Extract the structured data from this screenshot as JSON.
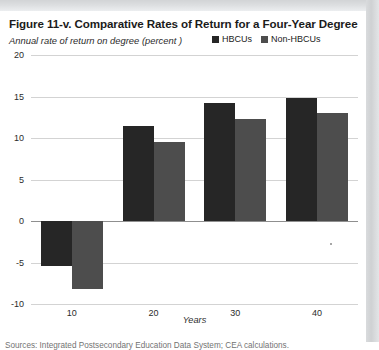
{
  "figure": {
    "title": "Figure 11-v. Comparative Rates of Return for a Four-Year Degree",
    "subtitle": "Annual rate of return on degree (percent )",
    "sources": "Sources: Integrated Postsecondary Education Data System; CEA calculations."
  },
  "colors": {
    "hbcu": "#262626",
    "non_hbcu": "#4d4d4d",
    "gridline": "#d3d3d3",
    "zero_line": "#8f8f8f",
    "text": "#1b1b1b"
  },
  "chart_data": {
    "type": "bar",
    "title": "Figure 11-v. Comparative Rates of Return for a Four-Year Degree",
    "subtitle": "Annual rate of return on degree (percent )",
    "categories": [
      "10",
      "20",
      "30",
      "40"
    ],
    "series": [
      {
        "name": "HBCUs",
        "color": "#262626",
        "values": [
          -5.4,
          11.5,
          14.2,
          14.8
        ]
      },
      {
        "name": "Non-HBCUs",
        "color": "#4d4d4d",
        "values": [
          -8.2,
          9.5,
          12.3,
          13.0
        ]
      }
    ],
    "xlabel": "Years",
    "ylabel": "Annual rate of return on degree (percent )",
    "ylim": [
      -10,
      20
    ],
    "yticks": [
      "20",
      "15",
      "10",
      "5",
      "0",
      "-5",
      "-10"
    ],
    "ytick_values": [
      20,
      15,
      10,
      5,
      0,
      -5,
      -10
    ],
    "grid": true,
    "legend_position": "top-right",
    "legend": [
      "HBCUs",
      "Non-HBCUs"
    ]
  }
}
